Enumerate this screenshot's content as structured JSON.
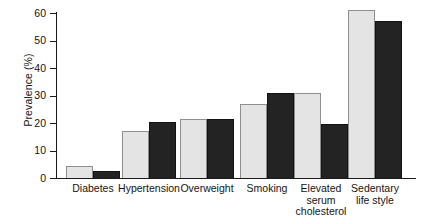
{
  "chart_data": {
    "type": "bar",
    "title": "",
    "xlabel": "",
    "ylabel": "Prevalence (%)",
    "ylim": [
      0,
      60
    ],
    "yticks": [
      0,
      10,
      20,
      30,
      40,
      50,
      60
    ],
    "grid": false,
    "legend": "none",
    "categories": [
      "Diabetes",
      "Hypertension",
      "Overweight",
      "Smoking",
      "Elevated serum cholesterol",
      "Sedentary life style"
    ],
    "series": [
      {
        "name": "light",
        "color": "#e4e4e4",
        "values": [
          4.5,
          17.0,
          21.5,
          27.0,
          31.0,
          61.0
        ]
      },
      {
        "name": "dark",
        "color": "#232323",
        "values": [
          2.5,
          20.5,
          21.5,
          31.0,
          19.8,
          57.0
        ]
      }
    ]
  },
  "axis": {
    "y_title": "Prevalence (%)",
    "tick_labels": [
      "0",
      "10",
      "20",
      "30",
      "40",
      "50",
      "60"
    ]
  },
  "category_labels": [
    [
      "Diabetes"
    ],
    [
      "Hypertension"
    ],
    [
      "Overweight"
    ],
    [
      "Smoking"
    ],
    [
      "Elevated",
      "serum",
      "cholesterol"
    ],
    [
      "Sedentary",
      "life style"
    ]
  ]
}
